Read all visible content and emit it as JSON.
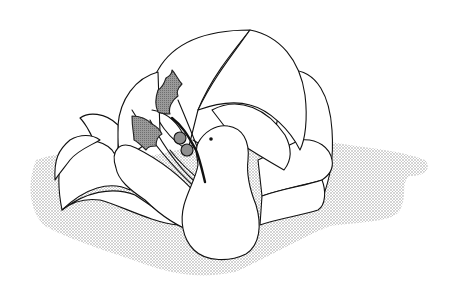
{
  "image": {
    "title": "Dove with holly sprig",
    "description": "Line-art clip illustration of a white dove with a fanned tail, carrying a holly sprig with two berries in its beak, resting on a stippled grey shadow."
  },
  "colors": {
    "background": "#ffffff",
    "outline": "#111111",
    "body_fill": "#ffffff",
    "holly_fill": "#8a8a8a",
    "berry_fill": "#8f8f8f",
    "shadow_dot": "#9a9a9a"
  },
  "elements": {
    "shadow": "stippled-ground-shadow",
    "dove": "dove-body",
    "eye": "dove-eye",
    "tail": "fanned-tail-feathers",
    "wing": "dove-wing",
    "holly_leaves": [
      "holly-leaf-upper",
      "holly-leaf-lower"
    ],
    "berries": [
      "berry-1",
      "berry-2"
    ],
    "stem": "holly-stem"
  }
}
